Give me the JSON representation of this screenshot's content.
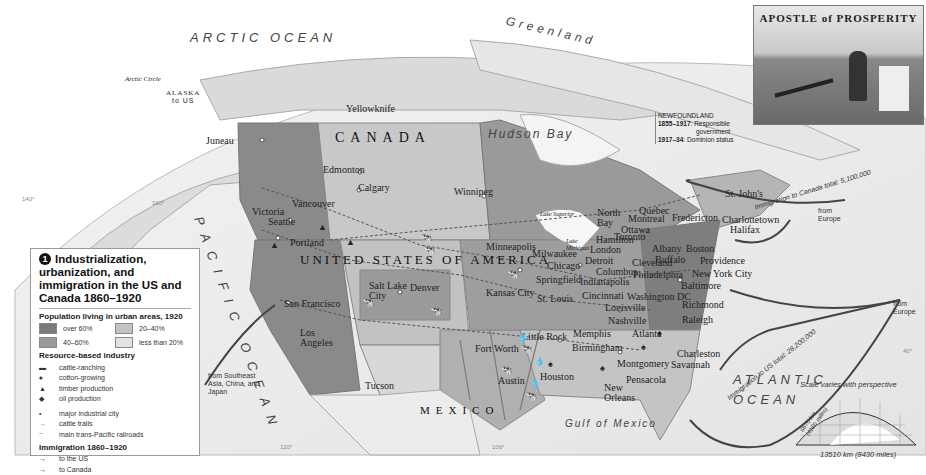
{
  "legend": {
    "number": "1",
    "title": "Industrialization, urbanization, and immigration in the US and Canada 1860–1920",
    "population_heading": "Population living in urban areas, 1920",
    "population_classes": [
      {
        "label": "over 60%",
        "color": "#7a7a7a"
      },
      {
        "label": "20–40%",
        "color": "#c4c4c4"
      },
      {
        "label": "40–60%",
        "color": "#9a9a9a"
      },
      {
        "label": "less than 20%",
        "color": "#e2e2e2"
      }
    ],
    "resource_heading": "Resource-based industry",
    "resources": [
      {
        "icon": "cattle-icon",
        "label": "cattle-ranching"
      },
      {
        "icon": "cotton-icon",
        "label": "cotton-growing"
      },
      {
        "icon": "tree-icon",
        "label": "timber production"
      },
      {
        "icon": "oil-drop-icon",
        "label": "oil production"
      }
    ],
    "symbols": [
      {
        "icon": "city-dot-icon",
        "label": "major industrial city"
      },
      {
        "icon": "cattle-trail-arrow-icon",
        "label": "cattle trails"
      },
      {
        "icon": "railroad-line-icon",
        "label": "main trans-Pacific railroads"
      }
    ],
    "immigration_heading": "Immigration 1860–1920",
    "immigration": [
      {
        "icon": "arrow-icon",
        "label": "to the US"
      },
      {
        "icon": "arrow-icon",
        "label": "to Canada"
      }
    ]
  },
  "caption": {
    "name": "Theodore Roosevelt",
    "text_1": ", president 1901–09,",
    "text_2": "presided over the",
    "text_3": "economic boom of",
    "text_4": "the early 20th century."
  },
  "poster": {
    "title": "APOSTLE of PROSPERITY"
  },
  "newfoundland": {
    "name": "NEWFOUNDLAND",
    "line1_year": "1855–1917",
    "line1_text": ": Responsible",
    "line1_text2": "government",
    "line2_year": "1917–34",
    "line2_text": ": Dominion status"
  },
  "oceans": {
    "arctic": "ARCTIC OCEAN",
    "pacific": "PACIFIC OCEAN",
    "atlantic1": "ATLANTIC",
    "atlantic2": "OCEAN",
    "hudson": "Hudson Bay",
    "gulf": "Gulf of Mexico",
    "greenland": "Greenland"
  },
  "countries": {
    "canada": "CANADA",
    "usa": "UNITED STATES OF AMERICA",
    "mexico": "MEXICO",
    "alaska": "ALASKA",
    "alaska_sub": "to US"
  },
  "places": {
    "arctic_circle": "Arctic Circle",
    "juneau": "Juneau",
    "yellowknife": "Yellowknife",
    "edmonton": "Edmonton",
    "calgary": "Calgary",
    "vancouver": "Vancouver",
    "victoria": "Victoria",
    "seattle": "Seattle",
    "portland": "Portland",
    "winnipeg": "Winnipeg",
    "san_francisco": "San Francisco",
    "los_angeles": "Los Angeles",
    "salt_lake": "Salt Lake City",
    "denver": "Denver",
    "tucson": "Tucson",
    "minneapolis": "Minneapolis",
    "milwaukee": "Milwaukee",
    "chicago": "Chicago",
    "kansas_city": "Kansas City",
    "st_louis": "St. Louis",
    "springfield": "Springfield",
    "indianapolis": "Indianapolis",
    "cincinnati": "Cincinnati",
    "louisville": "Louisville",
    "nashville": "Nashville",
    "memphis": "Memphis",
    "little_rock": "Little Rock",
    "fort_worth": "Fort Worth",
    "austin": "Austin",
    "houston": "Houston",
    "birmingham": "Birmingham",
    "atlanta": "Atlanta",
    "montgomery": "Montgomery",
    "pensacola": "Pensacola",
    "new_orleans": "New Orleans",
    "charleston": "Charleston",
    "savannah": "Savannah",
    "raleigh": "Raleigh",
    "richmond": "Richmond",
    "washington": "Washington DC",
    "baltimore": "Baltimore",
    "philadelphia": "Philadelphia",
    "new_york": "New York City",
    "providence": "Providence",
    "boston": "Boston",
    "albany": "Albany",
    "buffalo": "Buffalo",
    "cleveland": "Cleveland",
    "columbus": "Columbus",
    "detroit": "Detroit",
    "london": "London",
    "hamilton": "Hamilton",
    "toronto": "Toronto",
    "ottawa": "Ottawa",
    "montreal": "Montreal",
    "quebec": "Quebec",
    "north_bay": "North Bay",
    "fredericton": "Fredericton",
    "charlottetown": "Charlottetown",
    "halifax": "Halifax",
    "st_johns": "St. John's",
    "lake_superior": "Lake Superior",
    "lake_michigan": "Lake Michigan"
  },
  "immigration_labels": {
    "pacific_from": "from Southeast Asia, China, and Japan",
    "canada_total": "Immigration to Canada total: 5,100,000",
    "canada_from": "from Europe",
    "us_total": "Immigration to US total: 28,200,000",
    "us_from": "from Europe"
  },
  "scale": {
    "title": "Scale varies with perspective",
    "vertical": "6670 km (4160 miles)",
    "horizontal": "13510 km (8430 miles)"
  },
  "graticule": {
    "lon1": "140°",
    "lon2": "160°",
    "lon3": "120°",
    "lon4": "100°",
    "lon5": "40°"
  }
}
